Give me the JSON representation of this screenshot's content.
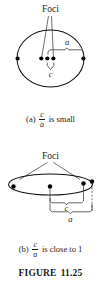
{
  "figure": {
    "caption_prefix": "FIGURE",
    "caption_number": "11.25"
  },
  "panel_a": {
    "foci_label": "Foci",
    "semi_major_label": "a",
    "focal_label": "c",
    "caption_prefix": "(a)",
    "caption_numerator": "c",
    "caption_denominator": "a",
    "caption_suffix": "is small",
    "shape": "ellipse-low-eccentricity",
    "dot_count": 5,
    "foci_count": 2
  },
  "panel_b": {
    "foci_label": "Foci",
    "semi_major_label": "a",
    "focal_label": "c",
    "caption_prefix": "(b)",
    "caption_numerator": "c",
    "caption_denominator": "a",
    "caption_suffix": "is close to 1",
    "shape": "ellipse-high-eccentricity",
    "dot_count": 4,
    "foci_count": 2
  },
  "colors": {
    "ink": "#111111",
    "annotation": "#333333",
    "background": "#ffffff"
  }
}
